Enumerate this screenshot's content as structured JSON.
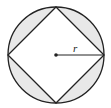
{
  "diagram": {
    "type": "geometry",
    "shapes": {
      "circle": {
        "cx": 56,
        "cy": 55,
        "r": 48
      },
      "inscribed_square": {
        "vertices": [
          [
            56,
            7
          ],
          [
            104,
            55
          ],
          [
            56,
            103
          ],
          [
            8,
            55
          ]
        ]
      },
      "center_point": {
        "cx": 56,
        "cy": 55
      },
      "radius_line": {
        "x1": 56,
        "y1": 55,
        "x2": 104,
        "y2": 55
      }
    },
    "labels": {
      "radius": "r"
    },
    "colors": {
      "stroke": "#222222",
      "segment_fill": "#e8e8e8",
      "background": "#ffffff"
    }
  }
}
